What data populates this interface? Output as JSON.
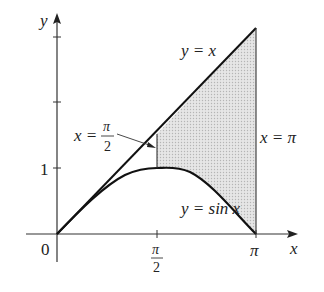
{
  "diagram": {
    "type": "area-between-curves",
    "axes": {
      "x_label": "x",
      "y_label": "y",
      "origin_label": "0",
      "x_ticks": [
        {
          "value": "π/2",
          "num": "π",
          "den": "2"
        },
        {
          "value": "π",
          "label": "π"
        }
      ],
      "y_ticks": [
        {
          "value": 1,
          "label": "1"
        }
      ]
    },
    "curves": [
      {
        "name": "line",
        "label": "y = x"
      },
      {
        "name": "sine",
        "label": "y = sin x"
      }
    ],
    "boundaries": [
      {
        "name": "x-pi-over-2",
        "label_lhs": "x =",
        "num": "π",
        "den": "2"
      },
      {
        "name": "x-pi",
        "label": "x = π"
      }
    ],
    "shaded_region": {
      "from": "π/2",
      "to": "π",
      "between": [
        "y = sin x",
        "y = x"
      ],
      "fill": "#d9d9d9"
    }
  }
}
